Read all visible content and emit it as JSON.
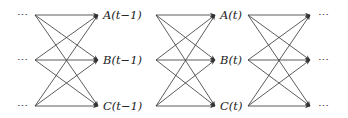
{
  "diagram": {
    "type": "time-unrolled fully-connected graph",
    "rows": [
      "A",
      "B",
      "C"
    ],
    "columns": [
      {
        "id": "prev",
        "labels": [
          "⋯",
          "⋯",
          "⋯"
        ]
      },
      {
        "id": "t-1",
        "labels": [
          "A(t−1)",
          "B(t−1)",
          "C(t−1)"
        ]
      },
      {
        "id": "t",
        "labels": [
          "A(t)",
          "B(t)",
          "C(t)"
        ]
      },
      {
        "id": "next",
        "labels": [
          "⋯",
          "⋯",
          "⋯"
        ]
      }
    ],
    "edges_description": "Every node in a column has a directed arrow to every node in the next column (3×3 fully connected between consecutive columns).",
    "colors": {
      "edge": "#333333",
      "text": "#222222",
      "background": "#ffffff"
    }
  }
}
